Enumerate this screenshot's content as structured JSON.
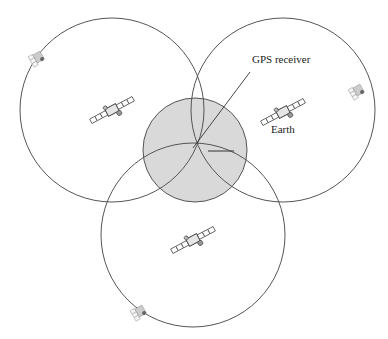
{
  "diagram": {
    "type": "gps-trilateration",
    "labels": {
      "receiver": "GPS receiver",
      "earth": "Earth"
    },
    "colors": {
      "stroke": "#555555",
      "earth_fill": "#d9d9d9",
      "background": "#ffffff"
    },
    "earth": {
      "cx": 195,
      "cy": 150,
      "r": 52
    },
    "receiver_point": {
      "x": 193,
      "y": 148
    },
    "range_spheres": [
      {
        "id": "left",
        "cx": 112,
        "cy": 110,
        "r": 92,
        "satellite_center": [
          112,
          110
        ],
        "satellite_edge": [
          38,
          58
        ]
      },
      {
        "id": "right",
        "cx": 283,
        "cy": 110,
        "r": 92,
        "satellite_center": [
          283,
          112
        ],
        "satellite_edge": [
          358,
          92
        ]
      },
      {
        "id": "bottom",
        "cx": 193,
        "cy": 235,
        "r": 92,
        "satellite_center": [
          193,
          240
        ],
        "satellite_edge": [
          140,
          312
        ]
      }
    ]
  }
}
